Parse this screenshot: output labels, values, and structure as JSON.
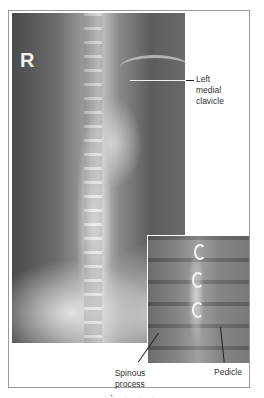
{
  "figure": {
    "main_image": {
      "description": "Frontal chest radiograph",
      "side_marker": "R"
    },
    "labels": {
      "left_medial_clavicle": [
        "Left",
        "medial",
        "clavicle"
      ],
      "spinous_process": [
        "Spinous",
        "process"
      ],
      "pedicle": "Pedicle"
    },
    "inset_image": {
      "description": "Magnified view of thoracic vertebrae"
    },
    "caption_partial": "· . . ."
  }
}
